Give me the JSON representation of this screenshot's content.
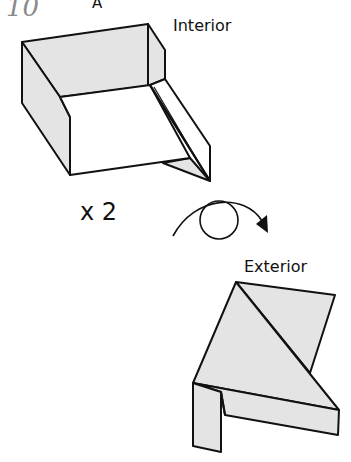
{
  "step": {
    "number": "10",
    "sub_label": "A"
  },
  "top_figure": {
    "label": "Interior",
    "fill_color": "#e4e4e4"
  },
  "repeat": {
    "label": "x 2"
  },
  "turn_over": {
    "icon": "turn-over-icon"
  },
  "bottom_figure": {
    "label": "Exterior",
    "fill_color": "#e4e4e4"
  }
}
